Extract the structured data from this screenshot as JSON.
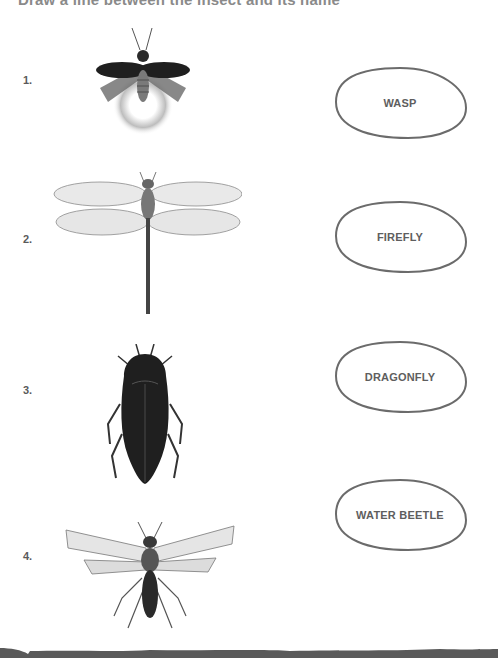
{
  "worksheet": {
    "title": "Draw a line between the insect and its name"
  },
  "items": [
    {
      "number": "1.",
      "insect": "firefly"
    },
    {
      "number": "2.",
      "insect": "dragonfly"
    },
    {
      "number": "3.",
      "insect": "water beetle"
    },
    {
      "number": "4.",
      "insect": "wasp"
    }
  ],
  "labels": [
    {
      "text": "WASP"
    },
    {
      "text": "FIREFLY"
    },
    {
      "text": "DRAGONFLY"
    },
    {
      "text": "WATER BEETLE"
    }
  ],
  "colors": {
    "text": "#5e5e5e",
    "oval_stroke": "#6b6b6b",
    "footer": "#5a5a5a"
  }
}
